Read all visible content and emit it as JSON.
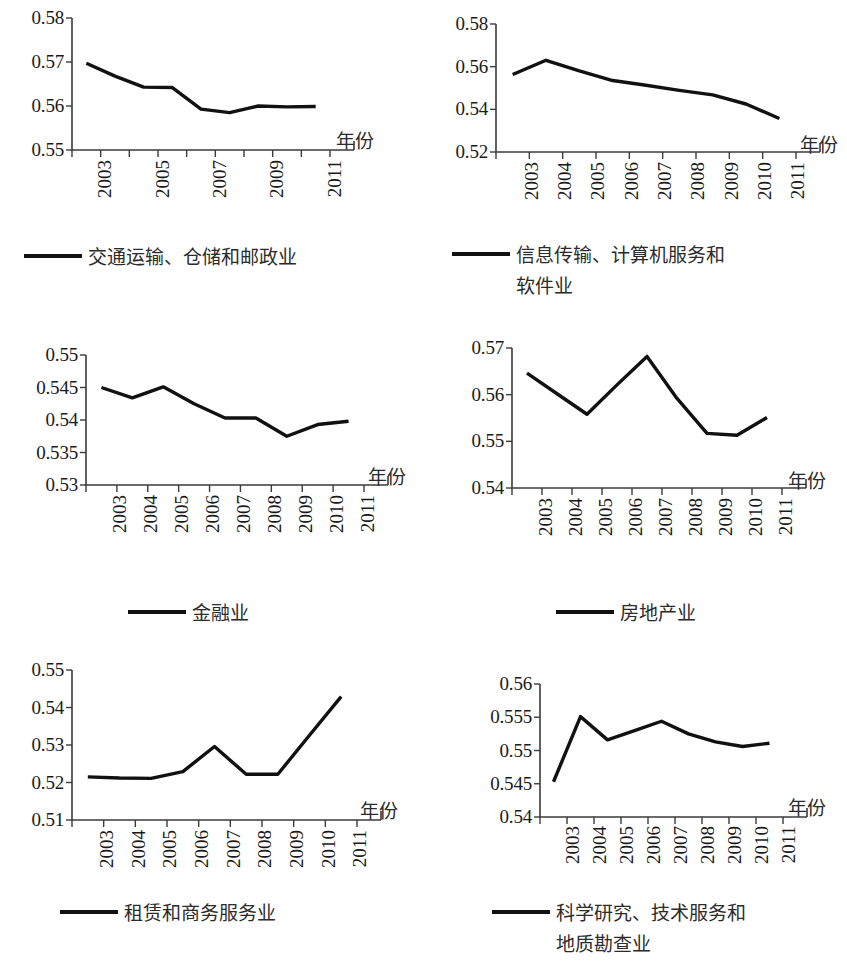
{
  "figure": {
    "axis_name": "年份",
    "line_color": "#111111",
    "axis_color": "#3b3b3b",
    "background": "#ffffff"
  },
  "chart_data": [
    {
      "type": "line",
      "title": "",
      "legend": "交通运输、仓储和邮政业",
      "legend_lines": [
        "交通运输、仓储和邮政业"
      ],
      "xlabel": "年份",
      "ylabel": "",
      "x": [
        2003,
        2004,
        2005,
        2006,
        2007,
        2008,
        2009,
        2010,
        2011
      ],
      "tick_labels": [
        "2003",
        "",
        "2005",
        "",
        "2007",
        "",
        "2009",
        "",
        "2011"
      ],
      "values": [
        0.5697,
        0.5668,
        0.5643,
        0.5642,
        0.5593,
        0.5585,
        0.56,
        0.5598,
        0.5599
      ],
      "yticks": [
        0.55,
        0.56,
        0.57,
        0.58
      ],
      "ytick_labels": [
        "0.55",
        "0.56",
        "0.57",
        "0.58"
      ],
      "ylim": [
        0.55,
        0.58
      ],
      "grid": false,
      "legend_position": "below"
    },
    {
      "type": "line",
      "title": "",
      "legend": "信息传输、计算机服务和软件业",
      "legend_lines": [
        "信息传输、计算机服务和",
        "软件业"
      ],
      "xlabel": "年份",
      "ylabel": "",
      "x": [
        2003,
        2004,
        2005,
        2006,
        2007,
        2008,
        2009,
        2010,
        2011
      ],
      "tick_labels": [
        "2003",
        "2004",
        "2005",
        "2006",
        "2007",
        "2008",
        "2009",
        "2010",
        "2011"
      ],
      "values": [
        0.5563,
        0.563,
        0.558,
        0.5535,
        0.5513,
        0.5489,
        0.5468,
        0.5425,
        0.5357
      ],
      "yticks": [
        0.52,
        0.54,
        0.56,
        0.58
      ],
      "ytick_labels": [
        "0.52",
        "0.54",
        "0.56",
        "0.58"
      ],
      "ylim": [
        0.52,
        0.58
      ],
      "grid": false,
      "legend_position": "below"
    },
    {
      "type": "line",
      "title": "",
      "legend": "金融业",
      "legend_lines": [
        "金融业"
      ],
      "xlabel": "年份",
      "ylabel": "",
      "x": [
        2003,
        2004,
        2005,
        2006,
        2007,
        2008,
        2009,
        2010,
        2011
      ],
      "tick_labels": [
        "2003",
        "2004",
        "2005",
        "2006",
        "2007",
        "2008",
        "2009",
        "2010",
        "2011"
      ],
      "values": [
        0.545,
        0.5434,
        0.5451,
        0.5425,
        0.5403,
        0.5403,
        0.5375,
        0.5393,
        0.5398
      ],
      "yticks": [
        0.53,
        0.535,
        0.54,
        0.545,
        0.55
      ],
      "ytick_labels": [
        "0.53",
        "0.535",
        "0.54",
        "0.545",
        "0.55"
      ],
      "ylim": [
        0.53,
        0.55
      ],
      "grid": false,
      "legend_position": "below"
    },
    {
      "type": "line",
      "title": "",
      "legend": "房地产业",
      "legend_lines": [
        "房地产业"
      ],
      "xlabel": "年份",
      "ylabel": "",
      "x": [
        2003,
        2004,
        2005,
        2006,
        2007,
        2008,
        2009,
        2010,
        2011
      ],
      "tick_labels": [
        "2003",
        "2004",
        "2005",
        "2006",
        "2007",
        "2008",
        "2009",
        "2010",
        "2011"
      ],
      "values": [
        0.5646,
        0.5602,
        0.5558,
        0.5621,
        0.5682,
        0.5592,
        0.5517,
        0.5513,
        0.5551
      ],
      "yticks": [
        0.54,
        0.55,
        0.56,
        0.57
      ],
      "ytick_labels": [
        "0.54",
        "0.55",
        "0.56",
        "0.57"
      ],
      "ylim": [
        0.54,
        0.57
      ],
      "grid": false,
      "legend_position": "below"
    },
    {
      "type": "line",
      "title": "",
      "legend": "租赁和商务服务业",
      "legend_lines": [
        "租赁和商务服务业"
      ],
      "xlabel": "年份",
      "ylabel": "",
      "x": [
        2003,
        2004,
        2005,
        2006,
        2007,
        2008,
        2009,
        2010,
        2011
      ],
      "tick_labels": [
        "2003",
        "2004",
        "2005",
        "2006",
        "2007",
        "2008",
        "2009",
        "2010",
        "2011"
      ],
      "values": [
        0.5215,
        0.5212,
        0.5211,
        0.5229,
        0.5296,
        0.5222,
        0.5222,
        0.5326,
        0.5429
      ],
      "yticks": [
        0.51,
        0.52,
        0.53,
        0.54,
        0.55
      ],
      "ytick_labels": [
        "0.51",
        "0.52",
        "0.53",
        "0.54",
        "0.55"
      ],
      "ylim": [
        0.51,
        0.55
      ],
      "grid": false,
      "legend_position": "below"
    },
    {
      "type": "line",
      "title": "",
      "legend": "科学研究、技术服务和地质勘查业",
      "legend_lines": [
        "科学研究、技术服务和",
        "地质勘查业"
      ],
      "xlabel": "年份",
      "ylabel": "",
      "x": [
        2003,
        2004,
        2005,
        2006,
        2007,
        2008,
        2009,
        2010,
        2011
      ],
      "tick_labels": [
        "2003",
        "2004",
        "2005",
        "2006",
        "2007",
        "2008",
        "2009",
        "2010",
        "2011"
      ],
      "values": [
        0.5453,
        0.5551,
        0.5516,
        0.553,
        0.5544,
        0.5525,
        0.5513,
        0.5506,
        0.5511
      ],
      "yticks": [
        0.54,
        0.545,
        0.55,
        0.555,
        0.56
      ],
      "ytick_labels": [
        "0.54",
        "0.545",
        "0.55",
        "0.555",
        "0.56"
      ],
      "ylim": [
        0.54,
        0.56
      ],
      "grid": false,
      "legend_position": "below"
    }
  ],
  "layout": [
    {
      "plot_left": 72,
      "plot_top": 18,
      "plot_w": 258,
      "plot_h": 132,
      "ylab_w": 64,
      "xlab_top": 160,
      "axisname_left": 336,
      "axisname_top": 126,
      "legend_left": 24,
      "legend_top": 242,
      "swatch_w": 58,
      "legend_center": false
    },
    {
      "plot_left": 496,
      "plot_top": 24,
      "plot_w": 300,
      "plot_h": 128,
      "ylab_w": 64,
      "xlab_top": 162,
      "axisname_left": 800,
      "axisname_top": 130,
      "legend_left": 452,
      "legend_top": 240,
      "swatch_w": 58,
      "legend_center": false
    },
    {
      "plot_left": 86,
      "plot_top": 355,
      "plot_w": 278,
      "plot_h": 130,
      "ylab_w": 78,
      "xlab_top": 495,
      "axisname_left": 368,
      "axisname_top": 462,
      "legend_left": 128,
      "legend_top": 598,
      "swatch_w": 58,
      "legend_center": false
    },
    {
      "plot_left": 512,
      "plot_top": 348,
      "plot_w": 270,
      "plot_h": 140,
      "ylab_w": 64,
      "xlab_top": 498,
      "axisname_left": 788,
      "axisname_top": 466,
      "legend_left": 556,
      "legend_top": 598,
      "swatch_w": 58,
      "legend_center": false
    },
    {
      "plot_left": 72,
      "plot_top": 670,
      "plot_w": 285,
      "plot_h": 150,
      "ylab_w": 64,
      "xlab_top": 830,
      "axisname_left": 360,
      "axisname_top": 796,
      "legend_left": 60,
      "legend_top": 898,
      "swatch_w": 58,
      "legend_center": false
    },
    {
      "plot_left": 540,
      "plot_top": 684,
      "plot_w": 243,
      "plot_h": 133,
      "ylab_w": 84,
      "xlab_top": 826,
      "axisname_left": 788,
      "axisname_top": 793,
      "legend_left": 492,
      "legend_top": 898,
      "swatch_w": 58,
      "legend_center": false
    }
  ]
}
